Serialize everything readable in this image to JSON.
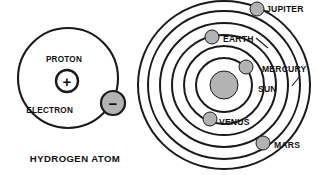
{
  "figure": {
    "background_color": "#ffffff",
    "ink_color": "#1a1a1a",
    "body_color": "#b3b3b3",
    "width": 316,
    "height": 175
  },
  "atom": {
    "caption": "HYDROGEN ATOM",
    "caption_x": 75,
    "caption_y": 162,
    "orbit": {
      "cx": 68,
      "cy": 78,
      "r": 50,
      "stroke_width": 2.1
    },
    "proton": {
      "label": "PROTON",
      "label_x": 64,
      "label_y": 62,
      "symbol": "+",
      "cx": 67,
      "cy": 81,
      "r": 11,
      "stroke_width": 2.4
    },
    "electron": {
      "label": "ELECTRON",
      "label_x": 73,
      "label_y": 113,
      "symbol": "−",
      "cx": 113,
      "cy": 103,
      "r": 12,
      "stroke_width": 2.2
    }
  },
  "solar_system": {
    "center": {
      "cx": 224,
      "cy": 85
    },
    "sun": {
      "label": "SUN",
      "label_x": 258,
      "label_y": 92,
      "cx": 224,
      "cy": 85,
      "r": 14
    },
    "orbits": [
      {
        "name": "mercury-orbit",
        "rx": 28,
        "ry": 27,
        "stroke_width": 2.0
      },
      {
        "name": "venus-orbit",
        "rx": 40,
        "ry": 39,
        "stroke_width": 2.0
      },
      {
        "name": "earth-orbit",
        "rx": 52,
        "ry": 50,
        "stroke_width": 2.0
      },
      {
        "name": "mars-orbit",
        "rx": 64,
        "ry": 62,
        "stroke_width": 2.0
      },
      {
        "name": "jupiter-orbit",
        "rx": 76,
        "ry": 74,
        "stroke_width": 2.0
      },
      {
        "name": "outer-orbit",
        "rx": 86,
        "ry": 84,
        "stroke_width": 2.0
      }
    ],
    "planets": [
      {
        "name": "jupiter",
        "label": "JUPITER",
        "cx": 257,
        "cy": 9,
        "r": 7,
        "label_x": 266,
        "label_y": 12,
        "anchor": "start",
        "leader": null
      },
      {
        "name": "earth",
        "label": "EARTH",
        "cx": 212,
        "cy": 37,
        "r": 7,
        "label_x": 223,
        "label_y": 42,
        "anchor": "start",
        "leader": {
          "x1": 256,
          "y1": 38,
          "x2": 268,
          "y2": 48
        }
      },
      {
        "name": "mercury",
        "label": "MERCURY",
        "cx": 246,
        "cy": 67,
        "r": 7,
        "label_x": 262,
        "label_y": 72,
        "anchor": "start",
        "leader": {
          "x1": 300,
          "y1": 76,
          "x2": 292,
          "y2": 86
        }
      },
      {
        "name": "venus",
        "label": "VENUS",
        "cx": 210,
        "cy": 119,
        "r": 7,
        "label_x": 219,
        "label_y": 125,
        "anchor": "start",
        "leader": null
      },
      {
        "name": "mars",
        "label": "MARS",
        "cx": 263,
        "cy": 143,
        "r": 7,
        "label_x": 274,
        "label_y": 148,
        "anchor": "start",
        "leader": null
      }
    ]
  }
}
